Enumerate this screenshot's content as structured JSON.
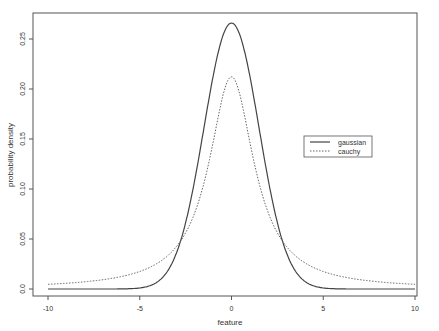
{
  "chart_data": {
    "type": "line",
    "title": "",
    "xlabel": "feature",
    "ylabel": "probability density",
    "xlim": [
      -10,
      10
    ],
    "ylim": [
      0,
      0.265
    ],
    "x_ticks": [
      -10,
      -5,
      0,
      5,
      10
    ],
    "x_tick_labels": [
      "-10",
      "-5",
      "0",
      "5",
      "10"
    ],
    "y_ticks": [
      0.0,
      0.05,
      0.1,
      0.15,
      0.2,
      0.25
    ],
    "y_tick_labels": [
      "0.0",
      "0.05",
      "0.10",
      "0.15",
      "0.20",
      "0.25"
    ],
    "grid": false,
    "legend_position": "right-middle",
    "series": [
      {
        "name": "gaussian",
        "style": "solid",
        "distribution": "normal",
        "params": {
          "mean": 0,
          "sd": 1.5
        },
        "peak": 0.265,
        "x": [
          -10,
          -5,
          -3,
          -2,
          -1,
          0,
          1,
          2,
          3,
          5,
          10
        ],
        "values": [
          0.0,
          0.001,
          0.036,
          0.109,
          0.213,
          0.266,
          0.213,
          0.109,
          0.036,
          0.001,
          0.0
        ]
      },
      {
        "name": "cauchy",
        "style": "dotted",
        "distribution": "cauchy",
        "params": {
          "location": 0,
          "scale": 1.5
        },
        "peak": 0.212,
        "x": [
          -10,
          -5,
          -3,
          -2,
          -1,
          0,
          1,
          2,
          3,
          5,
          10
        ],
        "values": [
          0.005,
          0.018,
          0.042,
          0.069,
          0.147,
          0.212,
          0.147,
          0.069,
          0.042,
          0.018,
          0.005
        ]
      }
    ]
  }
}
